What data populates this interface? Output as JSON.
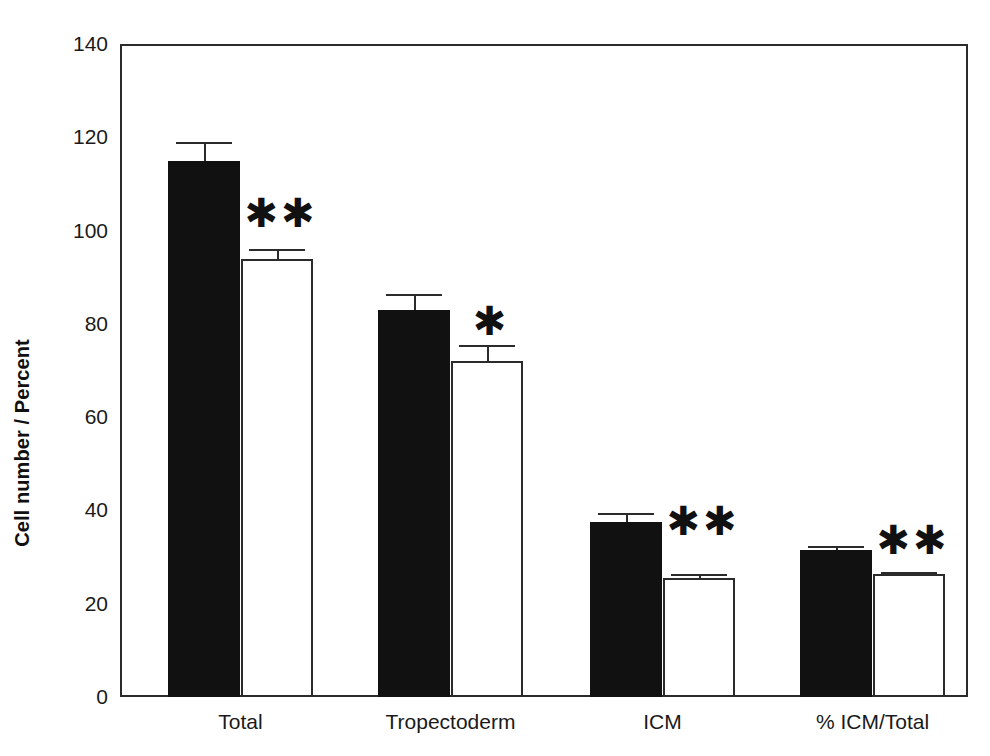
{
  "chart_data": {
    "type": "bar",
    "title": "",
    "subtitle": "",
    "xlabel": "",
    "ylabel": "Cell number / Percent",
    "categories": [
      "Total",
      "Tropectoderm",
      "ICM",
      "% ICM/Total"
    ],
    "ylim": [
      0,
      140
    ],
    "yticks": [
      0,
      20,
      40,
      60,
      80,
      100,
      120,
      140
    ],
    "ytick_labels": [
      "0",
      "20",
      "40",
      "60",
      "80",
      "100",
      "120",
      "140"
    ],
    "grid": false,
    "legend": "none",
    "series": [
      {
        "name": "filled",
        "fill": "#111111",
        "values": [
          115.0,
          83.0,
          37.5,
          31.5
        ],
        "errors": [
          4.0,
          3.5,
          2.0,
          0.8
        ]
      },
      {
        "name": "open",
        "fill": "#ffffff",
        "values": [
          94.0,
          72.0,
          25.5,
          26.3
        ],
        "errors": [
          2.0,
          3.5,
          0.8,
          0.6
        ]
      }
    ],
    "annotations": [
      {
        "group": "Total",
        "series": "open",
        "text": "✱✱",
        "label": "**",
        "y": 108
      },
      {
        "group": "Tropectoderm",
        "series": "open",
        "text": "✱",
        "label": "*",
        "y": 85
      },
      {
        "group": "ICM",
        "series": "open",
        "text": "✱✱",
        "label": "**",
        "y": 42
      },
      {
        "group": "% ICM/Total",
        "series": "open",
        "text": "✱✱",
        "label": "**",
        "y": 38
      }
    ]
  },
  "axis": {
    "y_title": "Cell number / Percent",
    "ticks": [
      {
        "value": "140"
      },
      {
        "value": "120"
      },
      {
        "value": "100"
      },
      {
        "value": "80"
      },
      {
        "value": "60"
      },
      {
        "value": "40"
      },
      {
        "value": "20"
      },
      {
        "value": "0"
      }
    ]
  },
  "groups": [
    {
      "label": "Total"
    },
    {
      "label": "Tropectoderm"
    },
    {
      "label": "ICM"
    },
    {
      "label": "% ICM/Total"
    }
  ],
  "colors": {
    "filled_bar": "#111111",
    "open_bar": "#ffffff",
    "axis": "#2b2b2b",
    "text": "#1a1a1a",
    "background": "#ffffff"
  }
}
